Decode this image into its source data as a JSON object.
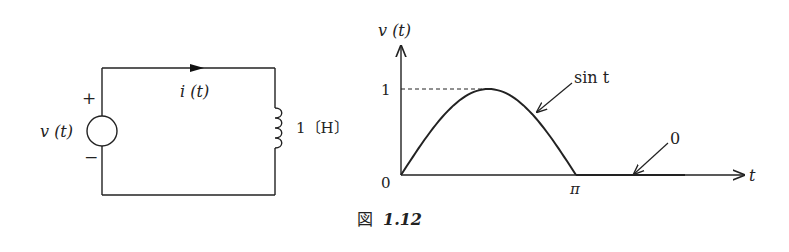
{
  "circuit": {
    "source_label": "v (t)",
    "plus_sign": "+",
    "minus_sign": "−",
    "current_label": "i (t)",
    "inductor_label": "1〔H〕"
  },
  "graph": {
    "y_axis_label": "v (t)",
    "x_axis_label": "t",
    "y_tick_1": "1",
    "origin_label": "0",
    "x_tick_pi": "π",
    "annotation_sin": "sin t",
    "annotation_zero": "0"
  },
  "caption": {
    "prefix": "図",
    "number": "1.12"
  },
  "chart_data": {
    "type": "line",
    "title": "",
    "xlabel": "t",
    "ylabel": "v (t)",
    "series": [
      {
        "name": "sin t",
        "x_range": [
          0,
          3.1416
        ],
        "formula": "sin t"
      },
      {
        "name": "0",
        "x_range": [
          3.1416,
          6.28
        ],
        "formula": "0"
      }
    ],
    "x_ticks": [
      "0",
      "π"
    ],
    "y_ticks": [
      "0",
      "1"
    ],
    "ylim": [
      0,
      1.1
    ],
    "grid": false,
    "annotations": [
      "sin t",
      "0"
    ]
  }
}
